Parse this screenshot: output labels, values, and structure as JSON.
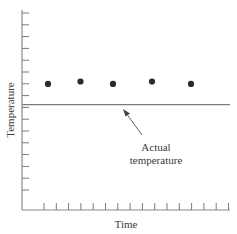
{
  "chart_data": {
    "type": "scatter",
    "title": "",
    "xlabel": "Time",
    "ylabel": "Temperature",
    "x_tick_count": 16,
    "y_tick_count": 16,
    "x_tick_labels": [],
    "y_tick_labels": [],
    "grid": false,
    "legend": null,
    "series": [
      {
        "name": "Measured temperature",
        "marker": "filled-circle",
        "color": "#2b2b2b",
        "x": [
          2,
          4.5,
          7,
          10,
          13
        ],
        "y": [
          10.4,
          10.6,
          10.4,
          10.6,
          10.4
        ]
      }
    ],
    "reference_lines": [
      {
        "name": "Actual temperature",
        "orientation": "horizontal",
        "y": 8.7,
        "color": "#7c7c7c"
      }
    ],
    "annotations": [
      {
        "text": "Actual\ntemperature",
        "arrow_to": "Actual temperature line"
      }
    ],
    "xlim": [
      0,
      16
    ],
    "ylim": [
      0,
      16.5
    ]
  },
  "labels": {
    "x_axis": "Time",
    "y_axis": "Temperature",
    "annotation_line1": "Actual",
    "annotation_line2": "temperature"
  }
}
